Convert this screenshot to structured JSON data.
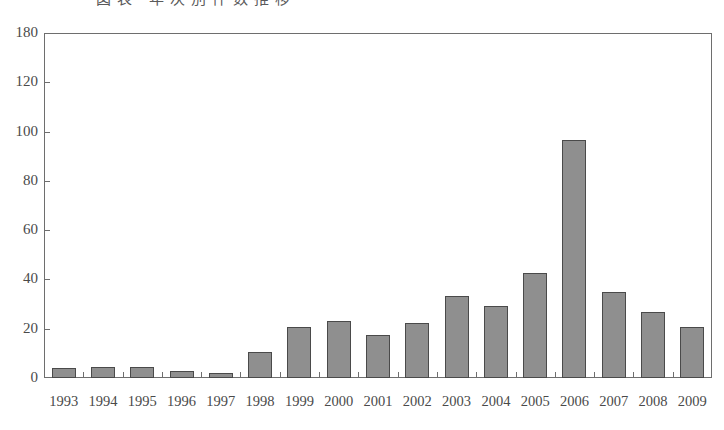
{
  "caption": {
    "text": "図表 年次別件数推移",
    "visible_note": "top caption is cropped off"
  },
  "chart_data": {
    "type": "bar",
    "title": "",
    "xlabel": "",
    "ylabel": "",
    "ylim": [
      0,
      180
    ],
    "grid": false,
    "legend": "none",
    "bar_color": "#8f8f8f",
    "bar_border_color": "#4a4a4a",
    "axis_color": "#6e6e6e",
    "ytick_labels": [
      "180",
      "120",
      "100",
      "80",
      "60",
      "40",
      "20",
      "0"
    ],
    "ytick_values": [
      180,
      120,
      100,
      80,
      60,
      40,
      20,
      0
    ],
    "categories": [
      "1993",
      "1994",
      "1995",
      "1996",
      "1997",
      "1998",
      "1999",
      "2000",
      "2001",
      "2002",
      "2003",
      "2004",
      "2005",
      "2006",
      "2007",
      "2008",
      "2009"
    ],
    "values": [
      5,
      6,
      5.5,
      3.5,
      2.5,
      13.5,
      26.5,
      29.5,
      22.5,
      28.5,
      43,
      37.5,
      55,
      124,
      45,
      34.5,
      26.5
    ]
  }
}
